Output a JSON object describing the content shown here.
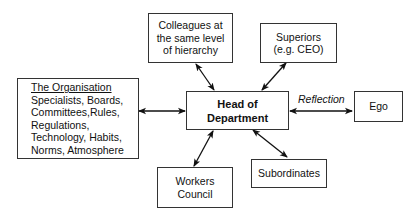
{
  "diagram": {
    "nodes": {
      "organisation": {
        "title": "The Organisation",
        "lines": [
          "Specialists, Boards,",
          "Committees,Rules,",
          "Regulations,",
          "Technology, Habits,",
          "Norms, Atmosphere"
        ]
      },
      "colleagues": {
        "lines": [
          "Colleagues at",
          "the same level",
          "of hierarchy"
        ]
      },
      "superiors": {
        "lines": [
          "Superiors",
          "(e.g. CEO)"
        ]
      },
      "head": {
        "lines": [
          "Head of",
          "Department"
        ]
      },
      "ego": {
        "lines": [
          "Ego"
        ]
      },
      "workers_council": {
        "lines": [
          "Workers",
          "Council"
        ]
      },
      "subordinates": {
        "lines": [
          "Subordinates"
        ]
      }
    },
    "edges": [
      {
        "from": "organisation",
        "to": "head",
        "type": "bidirectional",
        "label": ""
      },
      {
        "from": "colleagues",
        "to": "head",
        "type": "bidirectional",
        "label": ""
      },
      {
        "from": "superiors",
        "to": "head",
        "type": "bidirectional",
        "label": ""
      },
      {
        "from": "head",
        "to": "ego",
        "type": "bidirectional",
        "label": "Reflection"
      },
      {
        "from": "workers_council",
        "to": "head",
        "type": "bidirectional",
        "label": ""
      },
      {
        "from": "subordinates",
        "to": "head",
        "type": "bidirectional",
        "label": ""
      }
    ],
    "reflection_label": "Reflection",
    "colors": {
      "border": "#333333",
      "arrow": "#111111",
      "background": "#ffffff"
    }
  }
}
